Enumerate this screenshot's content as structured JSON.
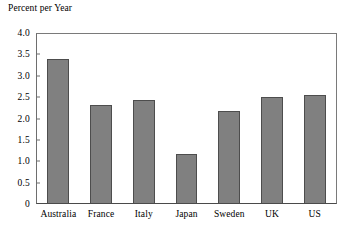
{
  "chart_data": {
    "type": "bar",
    "title": "Percent per Year",
    "xlabel": "",
    "ylabel": "Percent per Year",
    "categories": [
      "Australia",
      "France",
      "Italy",
      "Japan",
      "Sweden",
      "UK",
      "US"
    ],
    "values": [
      3.41,
      2.32,
      2.43,
      1.17,
      2.18,
      2.5,
      2.55
    ],
    "ylim": [
      0,
      4.0
    ],
    "ytick_values": [
      4.0,
      3.5,
      3.0,
      2.5,
      2.0,
      1.5,
      1.0,
      0.5,
      0
    ],
    "ytick_labels": [
      "4.0",
      "3.5",
      "3.0",
      "2.5",
      "2.0",
      "1.5",
      "1.0",
      "0.5",
      "0"
    ],
    "grid": false,
    "legend": null,
    "bar_color": "#808080",
    "bar_edge_color": "#4d4d4d",
    "frame_color": "#7a7a7a",
    "background_color": "#ffffff"
  }
}
